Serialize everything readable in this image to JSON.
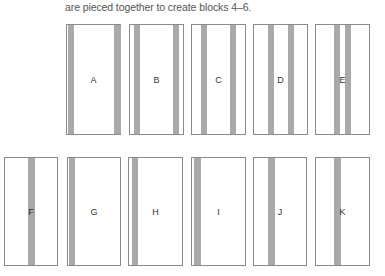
{
  "caption": "are pieced together to create blocks 4–6.",
  "colors": {
    "border": "#8a8a8a",
    "stripe": "#a9a9a9",
    "text": "#555555"
  },
  "blocks": [
    {
      "label": "A",
      "x": 66,
      "y": 24,
      "w": 55,
      "h": 111,
      "stripes": [
        [
          1,
          6
        ],
        [
          47,
          7
        ]
      ]
    },
    {
      "label": "B",
      "x": 129,
      "y": 24,
      "w": 55,
      "h": 111,
      "stripes": [
        [
          4,
          6
        ],
        [
          43,
          6
        ]
      ]
    },
    {
      "label": "C",
      "x": 191,
      "y": 24,
      "w": 55,
      "h": 111,
      "stripes": [
        [
          9,
          6
        ],
        [
          38,
          6
        ]
      ]
    },
    {
      "label": "D",
      "x": 253,
      "y": 24,
      "w": 55,
      "h": 111,
      "stripes": [
        [
          14,
          6
        ],
        [
          34,
          6
        ]
      ]
    },
    {
      "label": "E",
      "x": 315,
      "y": 24,
      "w": 55,
      "h": 111,
      "stripes": [
        [
          18,
          6
        ],
        [
          29,
          6
        ]
      ]
    },
    {
      "label": "F",
      "x": 4,
      "y": 157,
      "w": 54,
      "h": 109,
      "stripes": [
        [
          23,
          7
        ]
      ]
    },
    {
      "label": "G",
      "x": 67,
      "y": 157,
      "w": 54,
      "h": 109,
      "stripes": [
        [
          1,
          6
        ]
      ]
    },
    {
      "label": "H",
      "x": 128,
      "y": 157,
      "w": 55,
      "h": 109,
      "stripes": [
        [
          3,
          6
        ]
      ]
    },
    {
      "label": "I",
      "x": 191,
      "y": 157,
      "w": 55,
      "h": 109,
      "stripes": [
        [
          2,
          7
        ]
      ]
    },
    {
      "label": "J",
      "x": 253,
      "y": 157,
      "w": 54,
      "h": 109,
      "stripes": [
        [
          14,
          7
        ]
      ]
    },
    {
      "label": "K",
      "x": 315,
      "y": 157,
      "w": 55,
      "h": 109,
      "stripes": [
        [
          18,
          7
        ]
      ]
    }
  ]
}
